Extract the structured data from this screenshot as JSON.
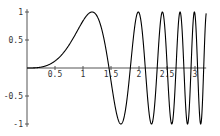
{
  "chart_data": {
    "type": "line",
    "title": "",
    "xlabel": "",
    "ylabel": "",
    "function": "sin(x^3)",
    "xlim": [
      0,
      3.2
    ],
    "ylim": [
      -1,
      1
    ],
    "grid": false,
    "legend": null,
    "x_ticks": [
      "0.5",
      "1",
      "1.5",
      "2",
      "2.5",
      "3"
    ],
    "y_ticks": [
      "1",
      "0.5",
      "-0.5",
      "-1"
    ],
    "series": [
      {
        "name": "f(x)",
        "color": "#000000",
        "samples": 400
      }
    ]
  },
  "layout": {
    "origin_px": [
      27,
      68
    ],
    "x_px_per_unit": 56,
    "y_px_per_unit": 56,
    "axis_color": "#555555",
    "line_color": "#000000"
  }
}
